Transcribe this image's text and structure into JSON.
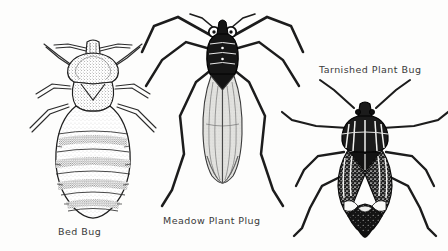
{
  "plate": {
    "title": "Insect identification plate",
    "background_color": "#fdfdfc",
    "ink_color": "#1a1a1a",
    "width": 448,
    "height": 251,
    "style": "black-and-white stippled pen-and-ink scientific illustration"
  },
  "figures": [
    {
      "id": "bed-bug",
      "caption": "Bed Bug",
      "caption_position": "below",
      "description": "Dorsal view of a flat oval wingless bug with banded segmented abdomen, short antennae and six legs"
    },
    {
      "id": "meadow-plant-bug",
      "caption": "Meadow Plant Plug",
      "caption_position": "below",
      "description": "Dorsal view of a slender long-legged bug with dark head and pronotum, large round eyes and long translucent wings"
    },
    {
      "id": "tarnished-plant-bug",
      "caption": "Tarnished Plant Bug",
      "caption_position": "above",
      "description": "Dorsal view of a shield-shaped mottled bug with long antennae and pale markings on dark wings"
    }
  ]
}
